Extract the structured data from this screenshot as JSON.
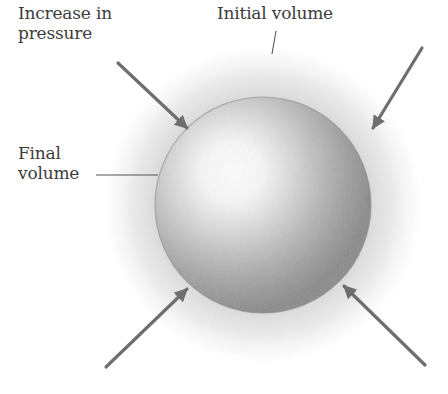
{
  "figure": {
    "labels": {
      "pressure_line1": "Increase in",
      "pressure_line2": "pressure",
      "initial_volume": "Initial volume",
      "final_line1": "Final",
      "final_line2": "volume"
    },
    "caption": "",
    "colors": {
      "arrow": "#6e6e6e",
      "sphere_edge": "#8f8f8f",
      "sphere_highlight": "#ffffff",
      "halo": "#cfcfcf",
      "text": "#3c3c3c",
      "leader_line": "#555555"
    },
    "geometry": {
      "sphere": {
        "cx": 263,
        "cy": 205,
        "r": 108
      },
      "halo": {
        "cx": 263,
        "cy": 205,
        "r": 160
      },
      "arrows": [
        {
          "name": "arrow-top-left",
          "x1": 118,
          "y1": 63,
          "x2": 187,
          "y2": 128
        },
        {
          "name": "arrow-top-right",
          "x1": 422,
          "y1": 48,
          "x2": 373,
          "y2": 128
        },
        {
          "name": "arrow-bottom-left",
          "x1": 106,
          "y1": 367,
          "x2": 187,
          "y2": 289
        },
        {
          "name": "arrow-bottom-right",
          "x1": 425,
          "y1": 365,
          "x2": 344,
          "y2": 286
        }
      ]
    }
  }
}
